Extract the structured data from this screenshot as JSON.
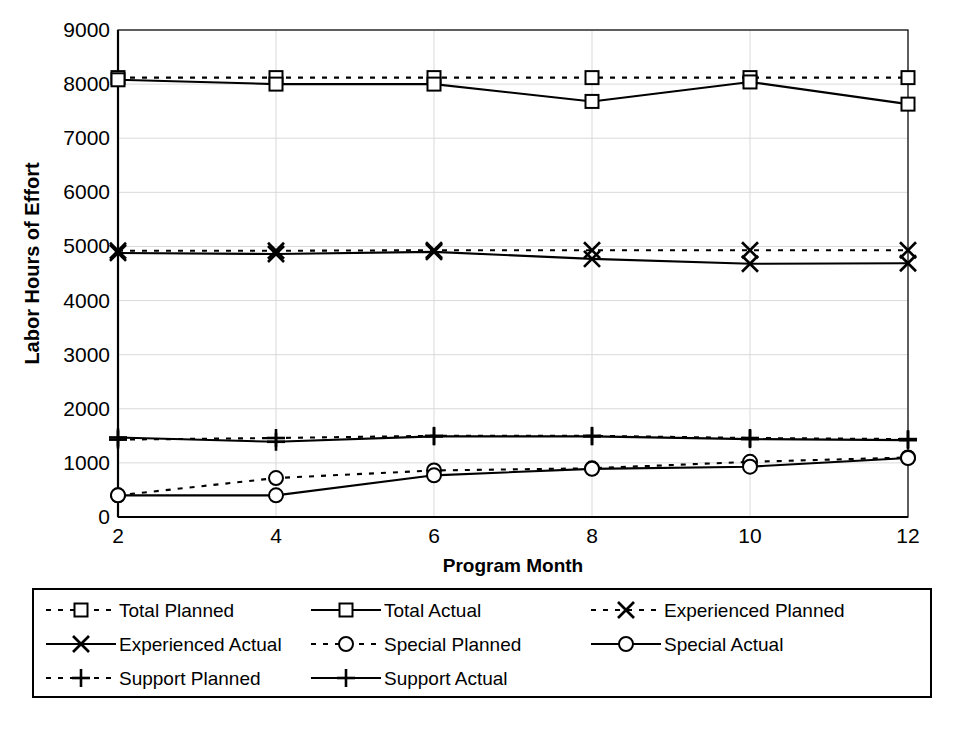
{
  "chart_data": {
    "type": "line",
    "title": "",
    "xlabel": "Program Month",
    "ylabel": "Labor Hours of Effort",
    "x": [
      2,
      4,
      6,
      8,
      10,
      12
    ],
    "xtick_labels": [
      "2",
      "4",
      "6",
      "8",
      "10",
      "12"
    ],
    "ytick_labels": [
      "0",
      "1000",
      "2000",
      "3000",
      "4000",
      "5000",
      "6000",
      "7000",
      "8000",
      "9000"
    ],
    "ytick_values": [
      0,
      1000,
      2000,
      3000,
      4000,
      5000,
      6000,
      7000,
      8000,
      9000
    ],
    "xlim": [
      2,
      12
    ],
    "ylim": [
      0,
      9000
    ],
    "grid": true,
    "legend_position": "bottom",
    "series": [
      {
        "name": "Total Planned",
        "values": [
          8120,
          8120,
          8120,
          8120,
          8120,
          8120
        ],
        "style": "dotted",
        "marker": "square",
        "color": "#000000"
      },
      {
        "name": "Total Actual",
        "values": [
          8080,
          8000,
          8000,
          7680,
          8040,
          7630
        ],
        "style": "solid",
        "marker": "square",
        "color": "#000000"
      },
      {
        "name": "Experienced Planned",
        "values": [
          4920,
          4920,
          4930,
          4930,
          4930,
          4930
        ],
        "style": "dotted",
        "marker": "cross-x",
        "color": "#000000"
      },
      {
        "name": "Experienced Actual",
        "values": [
          4880,
          4860,
          4900,
          4770,
          4680,
          4690
        ],
        "style": "solid",
        "marker": "cross-x",
        "color": "#000000"
      },
      {
        "name": "Special Planned",
        "values": [
          400,
          720,
          860,
          900,
          1020,
          1100
        ],
        "style": "dotted",
        "marker": "circle",
        "color": "#000000"
      },
      {
        "name": "Special Actual",
        "values": [
          400,
          400,
          770,
          890,
          930,
          1090
        ],
        "style": "solid",
        "marker": "circle",
        "color": "#000000"
      },
      {
        "name": "Support Planned",
        "values": [
          1430,
          1460,
          1500,
          1500,
          1460,
          1440
        ],
        "style": "dotted",
        "marker": "plus",
        "color": "#000000"
      },
      {
        "name": "Support Actual",
        "values": [
          1470,
          1390,
          1490,
          1490,
          1440,
          1420
        ],
        "style": "solid",
        "marker": "plus",
        "color": "#000000"
      }
    ]
  },
  "legend": {
    "entries": [
      {
        "label": "Total Planned",
        "style": "dotted",
        "marker": "square",
        "col": 0,
        "row": 0
      },
      {
        "label": "Total Actual",
        "style": "solid",
        "marker": "square",
        "col": 1,
        "row": 0
      },
      {
        "label": "Experienced Planned",
        "style": "dotted",
        "marker": "cross-x",
        "col": 2,
        "row": 0
      },
      {
        "label": "Experienced Actual",
        "style": "solid",
        "marker": "cross-x",
        "col": 0,
        "row": 1
      },
      {
        "label": "Special Planned",
        "style": "dotted",
        "marker": "circle",
        "col": 1,
        "row": 1
      },
      {
        "label": "Special Actual",
        "style": "solid",
        "marker": "circle",
        "col": 2,
        "row": 1
      },
      {
        "label": "Support Planned",
        "style": "dotted",
        "marker": "plus",
        "col": 0,
        "row": 2
      },
      {
        "label": "Support Actual",
        "style": "solid",
        "marker": "plus",
        "col": 1,
        "row": 2
      }
    ]
  },
  "style": {
    "axis_color": "#000000",
    "grid_color": "#d9d9d9",
    "background": "#ffffff"
  }
}
